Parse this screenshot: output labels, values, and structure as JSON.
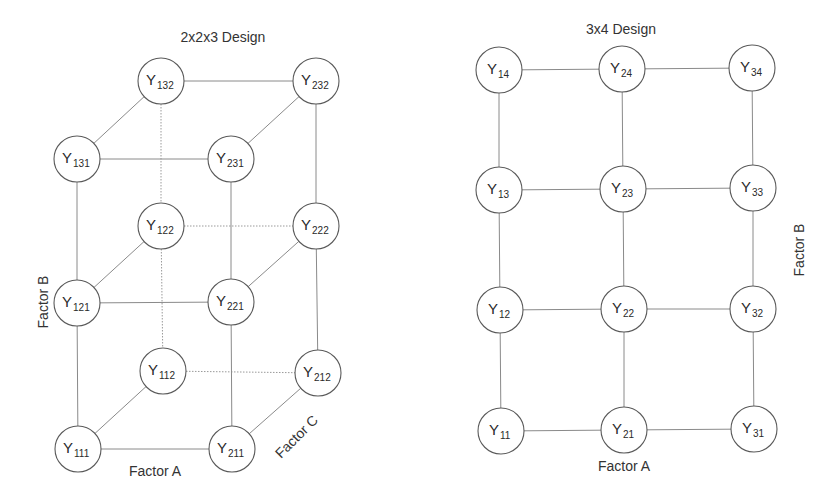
{
  "diagrams": [
    {
      "id": "left",
      "title": "2x2x3 Design",
      "title_pos": [
        223,
        42
      ],
      "radius": 23,
      "nodes": [
        {
          "name": "Y",
          "sub": "132",
          "x": 161,
          "y": 81
        },
        {
          "name": "Y",
          "sub": "232",
          "x": 316,
          "y": 81
        },
        {
          "name": "Y",
          "sub": "131",
          "x": 77,
          "y": 159
        },
        {
          "name": "Y",
          "sub": "231",
          "x": 231,
          "y": 159
        },
        {
          "name": "Y",
          "sub": "122",
          "x": 161,
          "y": 226
        },
        {
          "name": "Y",
          "sub": "222",
          "x": 316,
          "y": 226
        },
        {
          "name": "Y",
          "sub": "121",
          "x": 77,
          "y": 303
        },
        {
          "name": "Y",
          "sub": "221",
          "x": 231,
          "y": 302
        },
        {
          "name": "Y",
          "sub": "112",
          "x": 163,
          "y": 371
        },
        {
          "name": "Y",
          "sub": "212",
          "x": 318,
          "y": 373
        },
        {
          "name": "Y",
          "sub": "111",
          "x": 78,
          "y": 449
        },
        {
          "name": "Y",
          "sub": "211",
          "x": 232,
          "y": 449
        }
      ],
      "edges": [
        {
          "from": "132",
          "to": "232",
          "style": "solid"
        },
        {
          "from": "131",
          "to": "231",
          "style": "solid"
        },
        {
          "from": "131",
          "to": "132",
          "style": "solid"
        },
        {
          "from": "231",
          "to": "232",
          "style": "solid"
        },
        {
          "from": "122",
          "to": "222",
          "style": "dotted"
        },
        {
          "from": "121",
          "to": "221",
          "style": "solid"
        },
        {
          "from": "121",
          "to": "122",
          "style": "solid"
        },
        {
          "from": "221",
          "to": "222",
          "style": "solid"
        },
        {
          "from": "112",
          "to": "212",
          "style": "dotted"
        },
        {
          "from": "111",
          "to": "211",
          "style": "solid"
        },
        {
          "from": "111",
          "to": "112",
          "style": "solid"
        },
        {
          "from": "211",
          "to": "212",
          "style": "solid"
        },
        {
          "from": "131",
          "to": "121",
          "style": "solid"
        },
        {
          "from": "121",
          "to": "111",
          "style": "solid"
        },
        {
          "from": "231",
          "to": "221",
          "style": "solid"
        },
        {
          "from": "221",
          "to": "211",
          "style": "solid"
        },
        {
          "from": "132",
          "to": "122",
          "style": "dotted"
        },
        {
          "from": "122",
          "to": "112",
          "style": "dotted"
        },
        {
          "from": "232",
          "to": "222",
          "style": "solid"
        },
        {
          "from": "222",
          "to": "212",
          "style": "solid"
        }
      ],
      "axis_labels": [
        {
          "text": "Factor A",
          "x": 155,
          "y": 476,
          "rotate": 0
        },
        {
          "text": "Factor B",
          "x": 48,
          "y": 302,
          "rotate": -90
        },
        {
          "text": "Factor C",
          "x": 300,
          "y": 440,
          "rotate": -45
        }
      ]
    },
    {
      "id": "right",
      "title": "3x4 Design",
      "title_pos": [
        621,
        34
      ],
      "radius": 23,
      "nodes": [
        {
          "name": "Y",
          "sub": "14",
          "x": 499,
          "y": 70
        },
        {
          "name": "Y",
          "sub": "24",
          "x": 622,
          "y": 69
        },
        {
          "name": "Y",
          "sub": "34",
          "x": 752,
          "y": 68
        },
        {
          "name": "Y",
          "sub": "13",
          "x": 499,
          "y": 190
        },
        {
          "name": "Y",
          "sub": "23",
          "x": 623,
          "y": 189
        },
        {
          "name": "Y",
          "sub": "33",
          "x": 753,
          "y": 188
        },
        {
          "name": "Y",
          "sub": "12",
          "x": 500,
          "y": 310
        },
        {
          "name": "Y",
          "sub": "22",
          "x": 624,
          "y": 309
        },
        {
          "name": "Y",
          "sub": "32",
          "x": 753,
          "y": 309
        },
        {
          "name": "Y",
          "sub": "11",
          "x": 501,
          "y": 431
        },
        {
          "name": "Y",
          "sub": "21",
          "x": 624,
          "y": 430
        },
        {
          "name": "Y",
          "sub": "31",
          "x": 754,
          "y": 429
        }
      ],
      "edges": [
        {
          "from": "14",
          "to": "24",
          "style": "solid"
        },
        {
          "from": "24",
          "to": "34",
          "style": "solid"
        },
        {
          "from": "13",
          "to": "23",
          "style": "solid"
        },
        {
          "from": "23",
          "to": "33",
          "style": "solid"
        },
        {
          "from": "12",
          "to": "22",
          "style": "solid"
        },
        {
          "from": "22",
          "to": "32",
          "style": "solid"
        },
        {
          "from": "11",
          "to": "21",
          "style": "solid"
        },
        {
          "from": "21",
          "to": "31",
          "style": "solid"
        },
        {
          "from": "14",
          "to": "13",
          "style": "solid"
        },
        {
          "from": "13",
          "to": "12",
          "style": "solid"
        },
        {
          "from": "12",
          "to": "11",
          "style": "solid"
        },
        {
          "from": "24",
          "to": "23",
          "style": "solid"
        },
        {
          "from": "23",
          "to": "22",
          "style": "solid"
        },
        {
          "from": "22",
          "to": "21",
          "style": "solid"
        },
        {
          "from": "34",
          "to": "33",
          "style": "solid"
        },
        {
          "from": "33",
          "to": "32",
          "style": "solid"
        },
        {
          "from": "32",
          "to": "31",
          "style": "solid"
        }
      ],
      "axis_labels": [
        {
          "text": "Factor A",
          "x": 624,
          "y": 471,
          "rotate": 0
        },
        {
          "text": "Factor B",
          "x": 804,
          "y": 250,
          "rotate": -90
        }
      ]
    }
  ],
  "colors": {
    "background": "#ffffff",
    "node_stroke": "#5a5a5a",
    "edge": "#8a8a8a",
    "text": "#2a2a2a"
  }
}
